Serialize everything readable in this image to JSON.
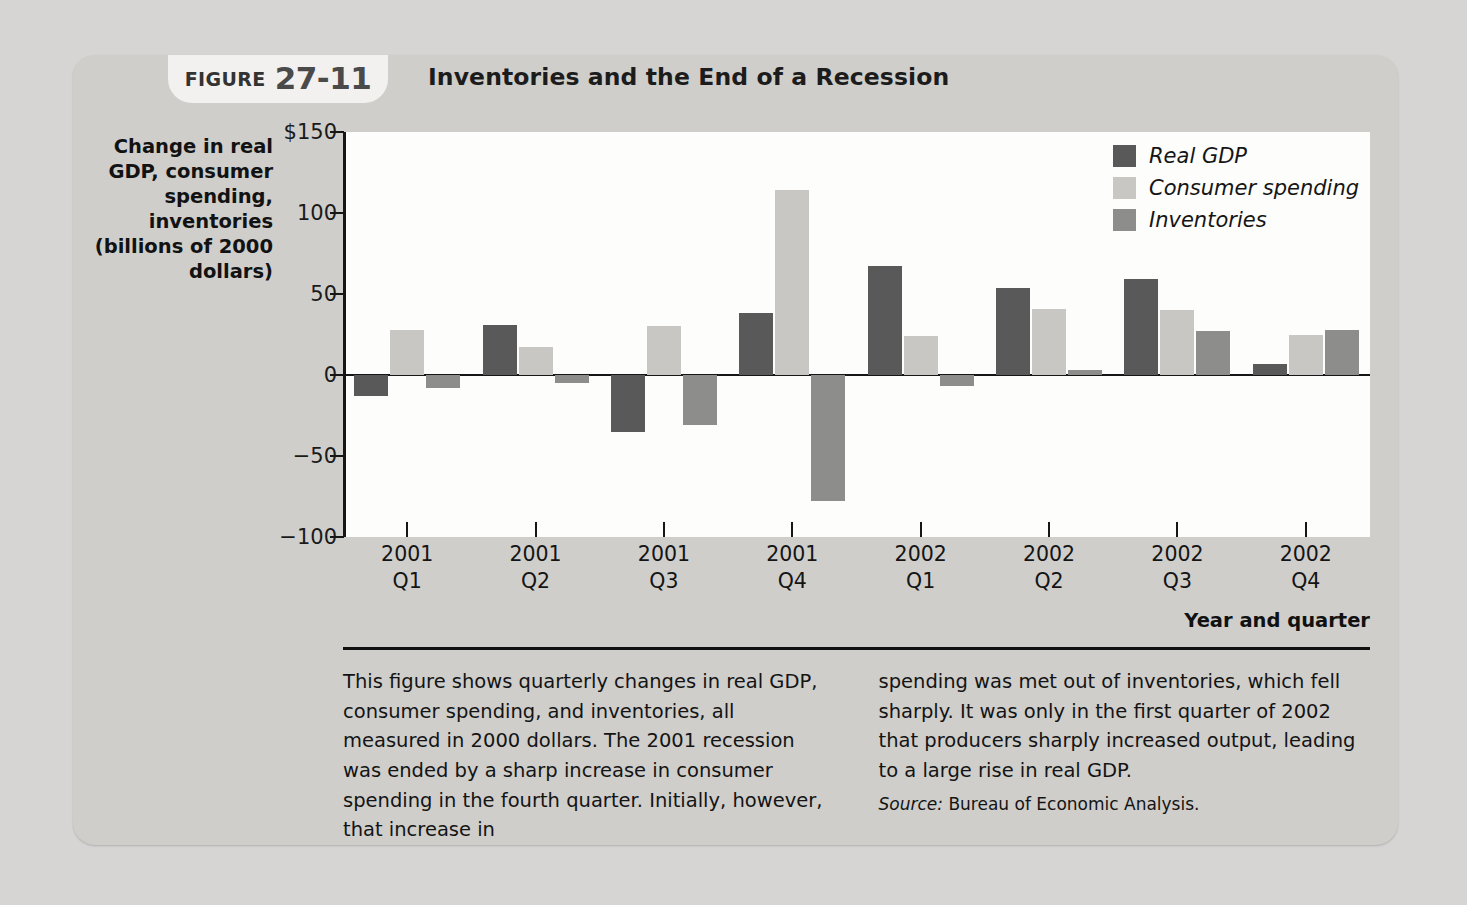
{
  "figure": {
    "tab_label": "Figure",
    "tab_number": "27-11",
    "title": "Inventories and the End of a Recession"
  },
  "chart_data": {
    "type": "bar",
    "title": "Inventories and the End of a Recession",
    "xlabel": "Year and quarter",
    "ylabel": "Change in real GDP, consumer spending, inventories (billions of 2000 dollars)",
    "ylim": [
      -100,
      150
    ],
    "yticks": [
      -100,
      -50,
      0,
      50,
      100,
      150
    ],
    "ytick_labels": [
      "−100",
      "−50",
      "0",
      "50",
      "100",
      "$150"
    ],
    "grid": false,
    "legend_position": "top-right",
    "categories": [
      "2001 Q1",
      "2001 Q2",
      "2001 Q3",
      "2001 Q4",
      "2002 Q1",
      "2002 Q2",
      "2002 Q3",
      "2002 Q4"
    ],
    "category_lines": [
      [
        "2001",
        "Q1"
      ],
      [
        "2001",
        "Q2"
      ],
      [
        "2001",
        "Q3"
      ],
      [
        "2001",
        "Q4"
      ],
      [
        "2002",
        "Q1"
      ],
      [
        "2002",
        "Q2"
      ],
      [
        "2002",
        "Q3"
      ],
      [
        "2002",
        "Q4"
      ]
    ],
    "series": [
      {
        "name": "Real GDP",
        "color": "#595959",
        "values": [
          -13,
          31,
          -35,
          38,
          67,
          54,
          59,
          7
        ]
      },
      {
        "name": "Consumer spending",
        "color": "#c8c7c4",
        "values": [
          28,
          17,
          30,
          114,
          24,
          41,
          40,
          25
        ]
      },
      {
        "name": "Inventories",
        "color": "#8d8d8b",
        "values": [
          -8,
          -5,
          -31,
          -78,
          -7,
          3,
          27,
          28
        ]
      }
    ]
  },
  "axis_titles": {
    "y": "Change in real GDP, consumer spending, inventories (billions of 2000 dollars)",
    "x": "Year and quarter"
  },
  "caption": {
    "left_column": "This figure shows quarterly changes in real GDP, consumer spending, and inventories, all measured in 2000 dollars. The 2001 recession was ended by a sharp increase in consumer spending in the fourth quarter. Initially, however, that increase in",
    "right_column": "spending was met out of inventories, which fell sharply. It was only in the first quarter of 2002 that producers sharply increased output, leading to a large rise in real GDP.",
    "source_label": "Source:",
    "source_text": "Bureau of Economic Analysis."
  }
}
